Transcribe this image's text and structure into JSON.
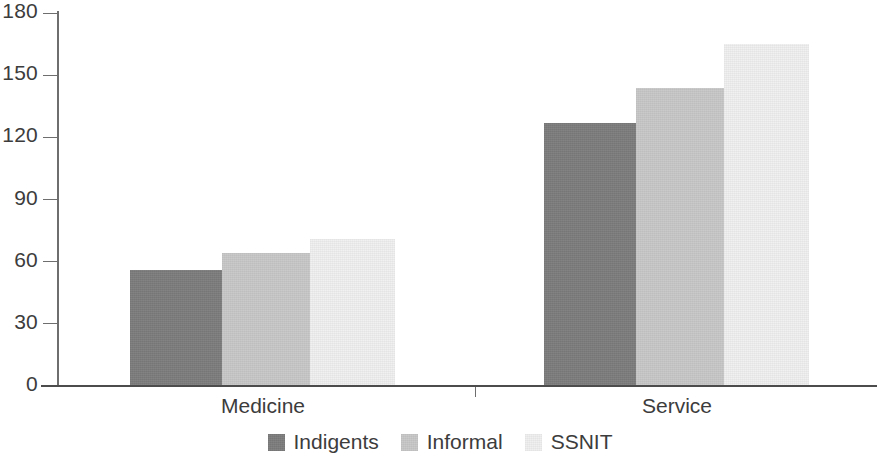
{
  "chart_data": {
    "type": "bar",
    "title": "",
    "subtitle": "",
    "xlabel": "",
    "ylabel": "",
    "categories": [
      "Medicine",
      "Service"
    ],
    "series": [
      {
        "name": "Indigents",
        "color": "#7d7d7d",
        "values": [
          56,
          127
        ]
      },
      {
        "name": "Informal",
        "color": "#c8c8c8",
        "values": [
          64,
          144
        ]
      },
      {
        "name": "SSNIT",
        "color": "#f0f0f0",
        "values": [
          71,
          165
        ]
      }
    ],
    "ylim": [
      0,
      180
    ],
    "yticks": [
      0,
      30,
      60,
      90,
      120,
      150,
      180
    ],
    "ytick_labels": [
      "0",
      "30",
      "60",
      "90",
      "120",
      "150",
      "180"
    ],
    "grid": false,
    "legend_position": "bottom"
  },
  "axis": {
    "y_labels": [
      "180",
      "150",
      "120",
      "90",
      "60",
      "30",
      "0"
    ],
    "x_labels": [
      "Medicine",
      "Service"
    ]
  },
  "legend": {
    "items": [
      {
        "label": "Indigents",
        "color": "#7d7d7d"
      },
      {
        "label": "Informal",
        "color": "#c8c8c8"
      },
      {
        "label": "SSNIT",
        "color": "#f0f0f0"
      }
    ]
  },
  "colors": {
    "axis": "#6e6e6e",
    "baseline": "#4c4c4c",
    "text": "#3c3c3c",
    "background": "#ffffff"
  }
}
